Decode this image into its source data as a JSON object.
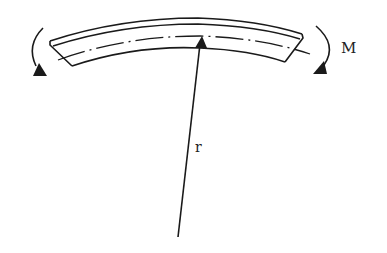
{
  "diagram": {
    "labels": {
      "moment": "M",
      "radius": "r"
    },
    "colors": {
      "stroke": "#1a1a1a",
      "background": "#ffffff"
    },
    "elements": [
      {
        "id": "curved-beam",
        "type": "bent beam segment"
      },
      {
        "id": "neutral-axis",
        "type": "dash-dot centerline"
      },
      {
        "id": "left-moment-arrow",
        "type": "counterclockwise curved arrow"
      },
      {
        "id": "right-moment-arrow",
        "type": "clockwise curved arrow"
      },
      {
        "id": "radius-arrow",
        "type": "straight arrow from center of curvature to neutral axis"
      }
    ]
  }
}
